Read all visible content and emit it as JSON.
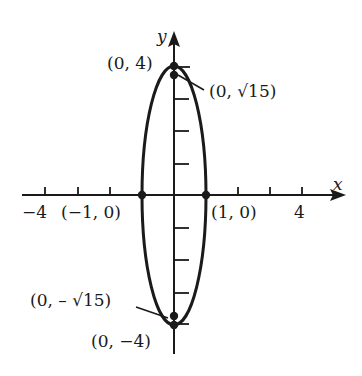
{
  "diagram": {
    "type": "ellipse-graph",
    "equation_center": [
      0,
      0
    ],
    "semi_axis_x": 1,
    "semi_axis_y": 4,
    "axes": {
      "x_label": "x",
      "y_label": "y",
      "x_tick_labels": {
        "neg": "−4",
        "pos": "4"
      }
    },
    "points": {
      "top_vertex": "(0, 4)",
      "top_focus": "(0, √15)",
      "left_covertex": "(−1, 0)",
      "right_covertex": "(1, 0)",
      "bottom_focus": "(0, – √15)",
      "bottom_vertex": "(0, −4)"
    },
    "colors": {
      "ink": "#1a1a1a",
      "background": "#ffffff"
    }
  }
}
